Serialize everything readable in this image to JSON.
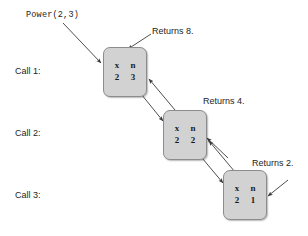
{
  "diagram": {
    "title_call": "Power(2,3)",
    "call_labels": [
      {
        "text": "Call 1:"
      },
      {
        "text": "Call 2:"
      },
      {
        "text": "Call 3:"
      }
    ],
    "returns_labels": [
      {
        "text": "Returns 8."
      },
      {
        "text": "Returns 4."
      },
      {
        "text": "Returns 2."
      }
    ],
    "frames": [
      {
        "header": {
          "col1": "x",
          "col2": "n"
        },
        "values": {
          "col1": "2",
          "col2": "3"
        }
      },
      {
        "header": {
          "col1": "x",
          "col2": "n"
        },
        "values": {
          "col1": "2",
          "col2": "2"
        }
      },
      {
        "header": {
          "col1": "x",
          "col2": "n"
        },
        "values": {
          "col1": "2",
          "col2": "1"
        }
      }
    ],
    "colors": {
      "box_fill": "#d2d2d2",
      "box_border": "#8c8c8c",
      "arrow": "#3a3a3a",
      "text": "#1d1d1d",
      "background": "#ffffff"
    }
  }
}
